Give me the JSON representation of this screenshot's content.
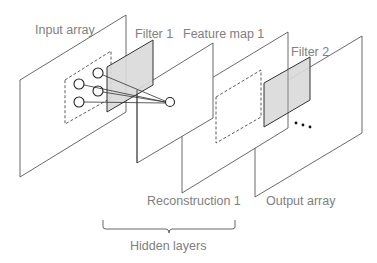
{
  "diagram": {
    "labels": {
      "input_array": "Input array",
      "filter_1": "Filter 1",
      "feature_map_1": "Feature map 1",
      "filter_2": "Filter 2",
      "reconstruction_1": "Reconstruction 1",
      "output_array": "Output array",
      "hidden_layers": "Hidden layers",
      "ellipsis": "..."
    },
    "colors": {
      "stroke": "#444444",
      "filter_fill": "#d9d9d9",
      "label": "#808080"
    }
  }
}
